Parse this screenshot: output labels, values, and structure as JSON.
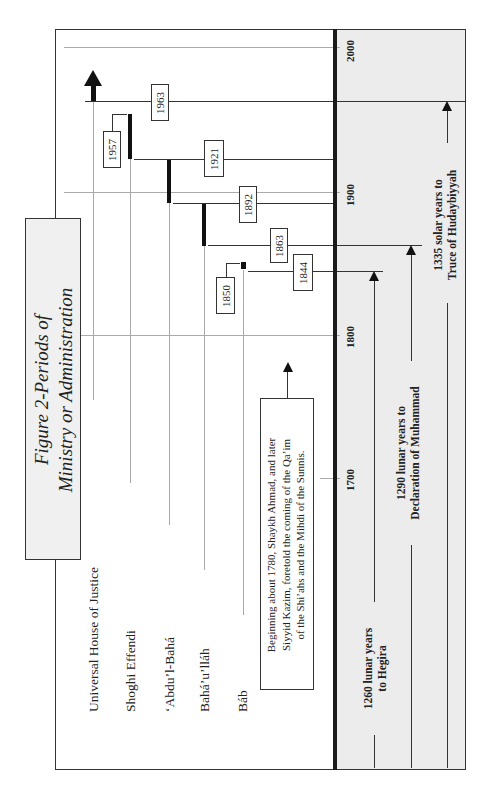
{
  "figure": {
    "title_line1": "Figure 2-Periods of",
    "title_line2": "Ministry or Administration",
    "orientation": "rotated 90° counter-clockwise"
  },
  "rows": [
    {
      "label": "Universal House of Justice",
      "start_year": "1963"
    },
    {
      "label": "Shoghi Effendi",
      "start_year": "1921",
      "end_year": "1957"
    },
    {
      "label": "‘Abdu’l-Bahá",
      "start_year": "1892",
      "end_year": "1921"
    },
    {
      "label": "Bahá’u’lláh",
      "start_year": "1863",
      "end_year": "1892"
    },
    {
      "label": "Báb",
      "start_year": "1844",
      "end_year": "1850"
    }
  ],
  "year_boxes": [
    "1963",
    "1957",
    "1921",
    "1892",
    "1863",
    "1850",
    "1844"
  ],
  "axis": {
    "ticks": [
      "2000",
      "1900",
      "1800",
      "1700"
    ]
  },
  "note": {
    "line1": "Beginning about 1780, Shaykh Ahmad, and later",
    "line2": "Siyyid Kazim, foretold the coming of the Qa’im",
    "line3": "of the Shi’ahs and the Mihdi of the Sunnis."
  },
  "periods": [
    {
      "line1": "1260 lunar years",
      "line2": "to Hegira",
      "target_year": "1844"
    },
    {
      "line1": "1290 lunar years to",
      "line2": "Declaration of Muhammad",
      "target_year": "1863"
    },
    {
      "line1": "1335 solar years to",
      "line2": "Truce of Hudaybiyyah",
      "target_year": "1963"
    }
  ]
}
